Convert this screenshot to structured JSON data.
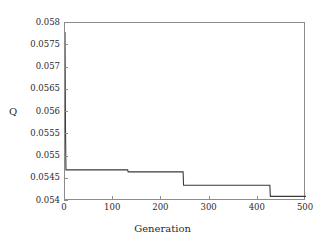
{
  "chart_data": {
    "type": "line",
    "title": "",
    "xlabel": "Generation",
    "ylabel": "Q",
    "xlim": [
      0,
      500
    ],
    "ylim": [
      0.054,
      0.058
    ],
    "grid": false,
    "legend": null,
    "xticks": [
      0,
      100,
      200,
      300,
      400,
      500
    ],
    "xtick_labels": [
      "0",
      "100",
      "200",
      "300",
      "400",
      "500"
    ],
    "yticks": [
      0.054,
      0.0545,
      0.055,
      0.0555,
      0.056,
      0.0565,
      0.057,
      0.0575,
      0.058
    ],
    "ytick_labels": [
      "0.054",
      "0.0545",
      "0.055",
      "0.0555",
      "0.056",
      "0.0565",
      "0.057",
      "0.0575",
      "0.058"
    ],
    "line_color": "#3a3a3a",
    "line_width": 1.1,
    "series": [
      {
        "name": "best Q",
        "step": "post",
        "x": [
          0,
          1,
          2,
          130,
          131,
          245,
          246,
          425,
          426,
          500
        ],
        "y": [
          0.0578,
          0.05565,
          0.0547,
          0.0547,
          0.054655,
          0.054655,
          0.054355,
          0.054355,
          0.054105,
          0.054105
        ]
      }
    ]
  }
}
